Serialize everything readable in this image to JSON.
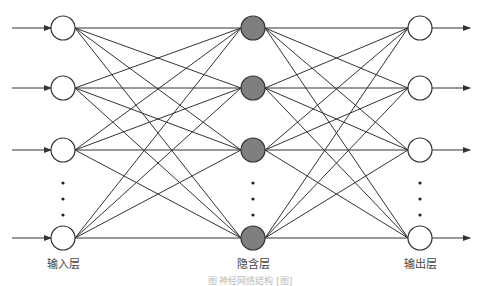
{
  "diagram": {
    "layers": [
      {
        "name": "input",
        "label": "输入层",
        "x": 63,
        "fill": "#ffffff"
      },
      {
        "name": "hidden",
        "label": "隐含层",
        "x": 253,
        "fill": "#7f7f7f"
      },
      {
        "name": "output",
        "label": "输出层",
        "x": 420,
        "fill": "#ffffff"
      }
    ],
    "node_y": [
      28,
      88,
      150,
      238
    ],
    "ellipsis_y": [
      183,
      199,
      215
    ],
    "node_radius": 12,
    "edge_color": "#333333",
    "caption": "图     神经网络结构 [图]"
  }
}
